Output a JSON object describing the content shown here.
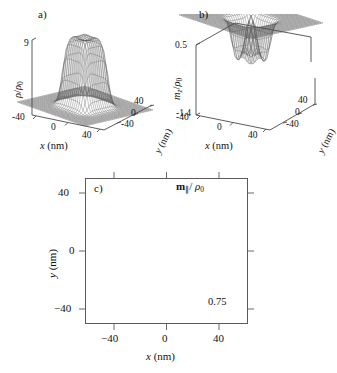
{
  "figure": {
    "background": "#ffffff",
    "line_color": "#3a3a3a",
    "panels": [
      "a)",
      "b)",
      "c)"
    ]
  },
  "panel_a": {
    "label": "a)",
    "zlabel_num": "ρ",
    "zlabel_den": "ρ",
    "zlabel_den_sub": "0",
    "zlabel_plain": "ρ/ρ₀",
    "ztick_top": "9",
    "xlabel": "x",
    "xlabel_unit": "(nm)",
    "ylabel": "y",
    "ylabel_unit": "(nm)",
    "xticks": [
      "-40",
      "0",
      "40"
    ],
    "yticks": [
      "40",
      "0",
      "-40"
    ]
  },
  "panel_b": {
    "label": "b)",
    "zlabel_num": "m",
    "zlabel_num_sub": "z",
    "zlabel_den": "ρ",
    "zlabel_den_sub": "0",
    "zlabel_plain": "m_z/ρ₀",
    "ztick_top": "0.5",
    "ztick_bottom": "-1.4",
    "xlabel": "x",
    "xlabel_unit": "(nm)",
    "ylabel": "y",
    "ylabel_unit": "(nm)",
    "xticks": [
      "-40",
      "0",
      "40"
    ],
    "yticks": [
      "40",
      "0",
      "-40"
    ]
  },
  "panel_c": {
    "label": "c)",
    "quantity_bold": "m",
    "quantity_sub": "∥",
    "quantity_den": "ρ",
    "quantity_den_sub": "0",
    "quantity_plain": "m∥/ρ₀",
    "scale_value": "0.75",
    "xlabel": "x",
    "xlabel_unit": "(nm)",
    "ylabel": "y",
    "ylabel_unit": "(nm)",
    "xticks": [
      "−40",
      "0",
      "40"
    ],
    "yticks": [
      "40",
      "0",
      "−40"
    ]
  },
  "chart_data": [
    {
      "type": "surface",
      "panel": "a",
      "title": "a)",
      "zlabel": "ρ/ρ₀",
      "xlabel": "x (nm)",
      "ylabel": "y (nm)",
      "xlim": [
        -60,
        60
      ],
      "ylim": [
        -60,
        60
      ],
      "zlim": [
        0,
        9
      ],
      "xticks": [
        -40,
        0,
        40
      ],
      "yticks": [
        -40,
        0,
        40
      ],
      "zticks": [
        9
      ],
      "description": "Wire-mesh 3D surface: flat-topped mesa (plateau) of normalized density rising from a near-zero baseline plane to a plateau of about 9, with a shallow dip at the plateau centre and steep rounded sidewalls.",
      "plateau_value": 9,
      "baseline_value": 0.3,
      "plateau_half_width_nm": 22,
      "wall_width_nm": 12,
      "center_dip_depth": 0.8,
      "grid": 36
    },
    {
      "type": "surface",
      "panel": "b",
      "title": "b)",
      "zlabel": "m_z/ρ₀",
      "xlabel": "x (nm)",
      "ylabel": "y (nm)",
      "xlim": [
        -60,
        60
      ],
      "ylim": [
        -60,
        60
      ],
      "zlim": [
        -1.4,
        0.5
      ],
      "xticks": [
        -40,
        0,
        40
      ],
      "yticks": [
        -40,
        0,
        40
      ],
      "zticks": [
        0.5,
        -1.4
      ],
      "description": "Wire-mesh 3D surface: flat outer plane near zero with a deep narrow cylindrical well plunging to about -1.4 at the centre, plus a small positive bump of about 0.5 at the very centre of the well rim.",
      "baseline_value": 0.0,
      "well_depth": -1.4,
      "well_half_width_nm": 18,
      "central_peak": 0.5,
      "grid": 36
    },
    {
      "type": "quiver",
      "panel": "c",
      "title": "c)",
      "quantity": "m∥/ρ₀",
      "xlabel": "x (nm)",
      "ylabel": "y (nm)",
      "xlim": [
        -55,
        55
      ],
      "ylim": [
        -55,
        55
      ],
      "xticks": [
        -40,
        0,
        40
      ],
      "yticks": [
        -40,
        0,
        40
      ],
      "grid": false,
      "scale_arrow": {
        "value": 0.75,
        "label": "0.75",
        "direction": "up"
      },
      "pattern": "clockwise flux-closure vortex",
      "description": "In-plane magnetisation vector field on a square grid. Arrows circulate clockwise about the origin forming a square flux-closure (Landau) pattern; magnitude is near zero at the centre core and at the far corners, peaking in an annular square ring at radius ~25 nm.",
      "n_x": 21,
      "n_y": 21,
      "spacing_nm": 5,
      "ring_radius_nm": 25,
      "ring_width_nm": 16,
      "max_magnitude": 0.75,
      "circulation_sign": -1
    }
  ]
}
